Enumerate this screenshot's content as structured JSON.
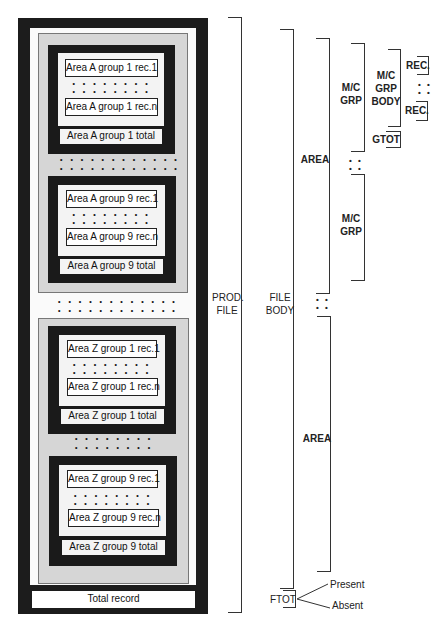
{
  "diagram": {
    "file_structure": {
      "areas": [
        {
          "id": "A",
          "groups": [
            {
              "rec_first": "Area A group 1 rec.1",
              "rec_last": "Area A group 1 rec.n",
              "total": "Area A group 1 total"
            },
            {
              "rec_first": "Area A group 9 rec.1",
              "rec_last": "Area A group 9 rec.n",
              "total": "Area A group 9 total"
            }
          ]
        },
        {
          "id": "Z",
          "groups": [
            {
              "rec_first": "Area Z group 1 rec.1",
              "rec_last": "Area Z group 1 rec.n",
              "total": "Area Z group 1 total"
            },
            {
              "rec_first": "Area Z group 9 rec.1",
              "rec_last": "Area Z group 9 rec.n",
              "total": "Area Z group 9 total"
            }
          ]
        }
      ],
      "total_record": "Total record",
      "ellipsis_short": "• • • • • • • •",
      "ellipsis_long": "• • • • • • • • • • • •"
    },
    "hierarchy_labels": {
      "prod_file": [
        "PROD.",
        "FILE"
      ],
      "file_body": [
        "FILE",
        "BODY"
      ],
      "area": "AREA",
      "mc_grp": [
        "M/C",
        "GRP"
      ],
      "mc_grp_body": [
        "M/C",
        "GRP",
        "BODY"
      ],
      "rec": "REC.",
      "gtot": "GTOT",
      "ftot": "FTOT",
      "present": "Present",
      "absent": "Absent",
      "vertical_ellipsis": "• •"
    }
  }
}
